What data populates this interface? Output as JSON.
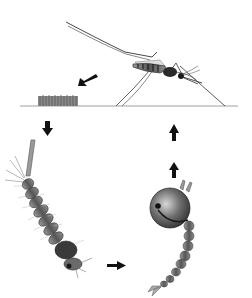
{
  "diagram": {
    "stages": [
      {
        "id": "adult",
        "name": "adult mosquito"
      },
      {
        "id": "eggs",
        "name": "egg raft"
      },
      {
        "id": "larva",
        "name": "larva"
      },
      {
        "id": "pupa",
        "name": "pupa"
      }
    ],
    "arrows": [
      {
        "from": "adult",
        "to": "eggs",
        "direction": "down-left"
      },
      {
        "from": "eggs",
        "to": "larva",
        "direction": "down"
      },
      {
        "from": "larva",
        "to": "pupa",
        "direction": "right"
      },
      {
        "from": "pupa",
        "to": "adult",
        "direction": "up"
      },
      {
        "from": "pupa",
        "to": "adult",
        "direction": "up"
      }
    ],
    "colors": {
      "background": "#ffffff",
      "ink": "#1a1a1a",
      "body_gray": "#6b6b6b",
      "light_gray": "#b5b5b5",
      "water_line": "#9a9a9a"
    }
  }
}
